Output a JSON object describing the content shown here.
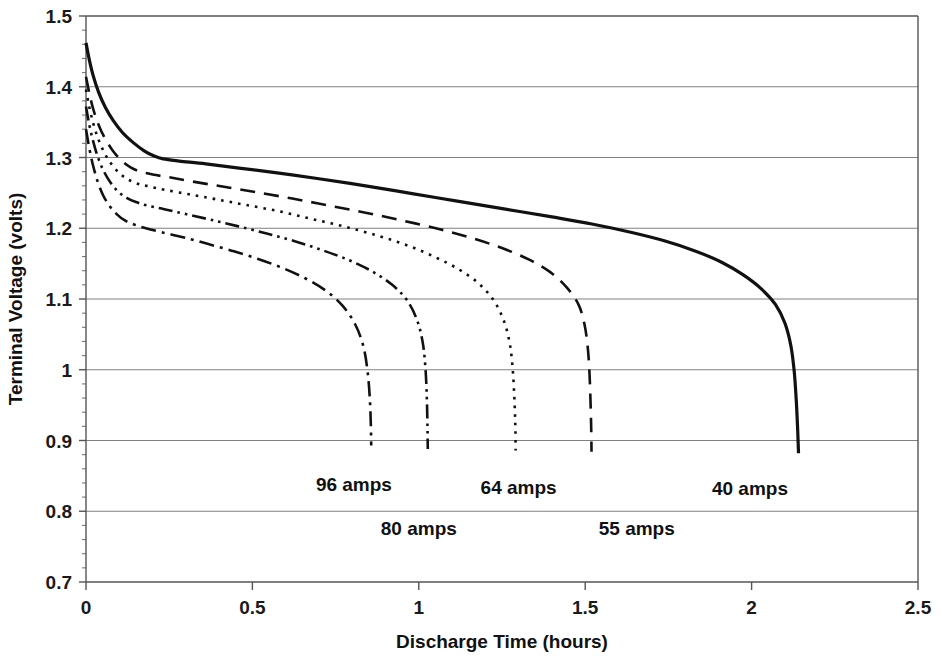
{
  "chart_data": {
    "type": "line",
    "title": "",
    "xlabel": "Discharge Time (hours)",
    "ylabel": "Terminal Voltage (volts)",
    "xlim": [
      0,
      2.5
    ],
    "ylim": [
      0.7,
      1.5
    ],
    "xticks": [
      "0",
      "0.5",
      "1",
      "1.5",
      "2",
      "2.5"
    ],
    "xtick_values": [
      0,
      0.5,
      1,
      1.5,
      2,
      2.5
    ],
    "yticks": [
      "1.5",
      "1.4",
      "1.3",
      "1.2",
      "1.1",
      "1",
      "0.9",
      "0.8",
      "0.7"
    ],
    "ytick_values": [
      1.5,
      1.4,
      1.3,
      1.2,
      1.1,
      1.0,
      0.9,
      0.8,
      0.7
    ],
    "grid": "horizontal",
    "legend_position": "inline-annotations",
    "line_color": "#111111",
    "series": [
      {
        "name": "40 amps",
        "style": "solid",
        "dash": "none",
        "width": 3.2,
        "label": "40 amps",
        "label_x": 1.995,
        "label_y": 0.823,
        "points": [
          [
            0.0,
            1.462
          ],
          [
            0.01,
            1.438
          ],
          [
            0.022,
            1.415
          ],
          [
            0.038,
            1.392
          ],
          [
            0.058,
            1.371
          ],
          [
            0.082,
            1.352
          ],
          [
            0.11,
            1.335
          ],
          [
            0.142,
            1.321
          ],
          [
            0.176,
            1.309
          ],
          [
            0.205,
            1.302
          ],
          [
            0.232,
            1.298
          ],
          [
            0.28,
            1.295
          ],
          [
            0.36,
            1.291
          ],
          [
            0.46,
            1.285
          ],
          [
            0.58,
            1.278
          ],
          [
            0.7,
            1.27
          ],
          [
            0.84,
            1.26
          ],
          [
            0.98,
            1.249
          ],
          [
            1.12,
            1.238
          ],
          [
            1.26,
            1.227
          ],
          [
            1.4,
            1.216
          ],
          [
            1.52,
            1.206
          ],
          [
            1.64,
            1.194
          ],
          [
            1.74,
            1.182
          ],
          [
            1.83,
            1.168
          ],
          [
            1.91,
            1.152
          ],
          [
            1.975,
            1.134
          ],
          [
            2.03,
            1.114
          ],
          [
            2.072,
            1.092
          ],
          [
            2.1,
            1.066
          ],
          [
            2.118,
            1.034
          ],
          [
            2.128,
            0.998
          ],
          [
            2.134,
            0.958
          ],
          [
            2.138,
            0.92
          ],
          [
            2.141,
            0.882
          ]
        ]
      },
      {
        "name": "55 amps",
        "style": "dashed",
        "dash": "15,9",
        "width": 2.6,
        "label": "55 amps",
        "label_x": 1.655,
        "label_y": 0.766,
        "points": [
          [
            0.0,
            1.414
          ],
          [
            0.01,
            1.391
          ],
          [
            0.022,
            1.368
          ],
          [
            0.038,
            1.346
          ],
          [
            0.057,
            1.327
          ],
          [
            0.08,
            1.31
          ],
          [
            0.106,
            1.296
          ],
          [
            0.134,
            1.286
          ],
          [
            0.164,
            1.28
          ],
          [
            0.2,
            1.276
          ],
          [
            0.25,
            1.272
          ],
          [
            0.32,
            1.266
          ],
          [
            0.41,
            1.259
          ],
          [
            0.51,
            1.251
          ],
          [
            0.62,
            1.242
          ],
          [
            0.73,
            1.232
          ],
          [
            0.84,
            1.222
          ],
          [
            0.95,
            1.211
          ],
          [
            1.06,
            1.199
          ],
          [
            1.16,
            1.186
          ],
          [
            1.25,
            1.172
          ],
          [
            1.33,
            1.156
          ],
          [
            1.395,
            1.138
          ],
          [
            1.445,
            1.116
          ],
          [
            1.48,
            1.092
          ],
          [
            1.498,
            1.064
          ],
          [
            1.508,
            1.03
          ],
          [
            1.513,
            0.994
          ],
          [
            1.516,
            0.955
          ],
          [
            1.518,
            0.918
          ],
          [
            1.519,
            0.884
          ]
        ]
      },
      {
        "name": "64 amps",
        "style": "dotted",
        "dash": "2.6,6",
        "width": 2.6,
        "label": "64 amps",
        "label_x": 1.3,
        "label_y": 0.825,
        "points": [
          [
            0.0,
            1.396
          ],
          [
            0.01,
            1.371
          ],
          [
            0.022,
            1.348
          ],
          [
            0.037,
            1.326
          ],
          [
            0.055,
            1.307
          ],
          [
            0.076,
            1.291
          ],
          [
            0.1,
            1.278
          ],
          [
            0.126,
            1.269
          ],
          [
            0.155,
            1.263
          ],
          [
            0.19,
            1.259
          ],
          [
            0.24,
            1.254
          ],
          [
            0.31,
            1.248
          ],
          [
            0.39,
            1.241
          ],
          [
            0.48,
            1.233
          ],
          [
            0.58,
            1.224
          ],
          [
            0.68,
            1.213
          ],
          [
            0.78,
            1.202
          ],
          [
            0.88,
            1.189
          ],
          [
            0.97,
            1.175
          ],
          [
            1.05,
            1.159
          ],
          [
            1.12,
            1.142
          ],
          [
            1.18,
            1.122
          ],
          [
            1.225,
            1.098
          ],
          [
            1.255,
            1.07
          ],
          [
            1.273,
            1.038
          ],
          [
            1.282,
            1.002
          ],
          [
            1.287,
            0.962
          ],
          [
            1.29,
            0.922
          ],
          [
            1.291,
            0.886
          ]
        ]
      },
      {
        "name": "80 amps",
        "style": "dash-dot-dot",
        "dash": "14,5,2.6,5,2.6,5",
        "width": 2.6,
        "label": "80 amps",
        "label_x": 1.0,
        "label_y": 0.766,
        "points": [
          [
            0.0,
            1.372
          ],
          [
            0.01,
            1.346
          ],
          [
            0.022,
            1.322
          ],
          [
            0.036,
            1.3
          ],
          [
            0.053,
            1.281
          ],
          [
            0.073,
            1.265
          ],
          [
            0.096,
            1.252
          ],
          [
            0.122,
            1.243
          ],
          [
            0.15,
            1.237
          ],
          [
            0.185,
            1.232
          ],
          [
            0.235,
            1.227
          ],
          [
            0.3,
            1.22
          ],
          [
            0.375,
            1.212
          ],
          [
            0.455,
            1.203
          ],
          [
            0.54,
            1.193
          ],
          [
            0.625,
            1.182
          ],
          [
            0.71,
            1.169
          ],
          [
            0.79,
            1.155
          ],
          [
            0.86,
            1.139
          ],
          [
            0.92,
            1.12
          ],
          [
            0.965,
            1.098
          ],
          [
            0.995,
            1.07
          ],
          [
            1.012,
            1.038
          ],
          [
            1.02,
            1.002
          ],
          [
            1.024,
            0.962
          ],
          [
            1.026,
            0.922
          ],
          [
            1.027,
            0.888
          ]
        ]
      },
      {
        "name": "96 amps",
        "style": "dash-dot",
        "dash": "15,6,3,6",
        "width": 2.6,
        "label": "96 amps",
        "label_x": 0.805,
        "label_y": 0.828,
        "points": [
          [
            0.0,
            1.34
          ],
          [
            0.01,
            1.313
          ],
          [
            0.021,
            1.289
          ],
          [
            0.035,
            1.266
          ],
          [
            0.051,
            1.247
          ],
          [
            0.07,
            1.232
          ],
          [
            0.092,
            1.22
          ],
          [
            0.117,
            1.211
          ],
          [
            0.146,
            1.205
          ],
          [
            0.18,
            1.2
          ],
          [
            0.23,
            1.194
          ],
          [
            0.295,
            1.187
          ],
          [
            0.365,
            1.178
          ],
          [
            0.44,
            1.168
          ],
          [
            0.515,
            1.157
          ],
          [
            0.59,
            1.144
          ],
          [
            0.66,
            1.129
          ],
          [
            0.72,
            1.112
          ],
          [
            0.77,
            1.091
          ],
          [
            0.808,
            1.065
          ],
          [
            0.833,
            1.034
          ],
          [
            0.846,
            0.998
          ],
          [
            0.853,
            0.958
          ],
          [
            0.856,
            0.92
          ],
          [
            0.857,
            0.893
          ]
        ]
      }
    ]
  }
}
